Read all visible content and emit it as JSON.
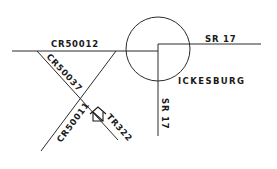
{
  "map": {
    "town": {
      "label": "ICKESBURG",
      "x": 178,
      "y": 84
    },
    "town_circle": {
      "cx": 158,
      "cy": 49,
      "r": 32
    },
    "roads": [
      {
        "id": "cr50012",
        "label": "CR50012",
        "label_x": 51,
        "label_y": 47,
        "label_rotate": 0
      },
      {
        "id": "sr17-east",
        "label": "SR 17",
        "label_x": 205,
        "label_y": 42,
        "label_rotate": 0
      },
      {
        "id": "sr17-south",
        "label": "SR 17",
        "label_x": 162,
        "label_y": 98,
        "label_rotate": 90
      },
      {
        "id": "cr50037",
        "label": "CR50037",
        "label_x": 44,
        "label_y": 58,
        "label_rotate": 42
      },
      {
        "id": "cr50011",
        "label": "CR50011",
        "label_x": 60,
        "label_y": 142,
        "label_rotate": -54
      },
      {
        "id": "tr322",
        "label": "TR322",
        "label_x": 104,
        "label_y": 121,
        "label_rotate": 48
      }
    ],
    "landmark": {
      "type": "house-icon",
      "x": 98,
      "y": 116
    }
  }
}
